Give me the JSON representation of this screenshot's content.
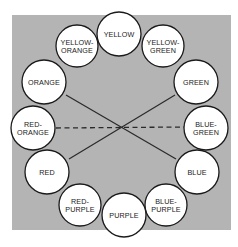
{
  "diagram": {
    "background_color": "#b4b4b4",
    "circles": [
      {
        "id": "yellow",
        "lines": [
          "YELLOW"
        ],
        "cx": 119,
        "cy": 34,
        "r": 22
      },
      {
        "id": "yellow-green",
        "lines": [
          "YELLOW-",
          "GREEN"
        ],
        "cx": 163,
        "cy": 46,
        "r": 21
      },
      {
        "id": "green",
        "lines": [
          "GREEN"
        ],
        "cx": 196,
        "cy": 82,
        "r": 22
      },
      {
        "id": "blue-green",
        "lines": [
          "BLUE-",
          "GREEN"
        ],
        "cx": 206,
        "cy": 128,
        "r": 22
      },
      {
        "id": "blue",
        "lines": [
          "BLUE"
        ],
        "cx": 197,
        "cy": 172,
        "r": 22
      },
      {
        "id": "blue-purple",
        "lines": [
          "BLUE-",
          "PURPLE"
        ],
        "cx": 166,
        "cy": 205,
        "r": 21
      },
      {
        "id": "purple",
        "lines": [
          "PURPLE"
        ],
        "cx": 124,
        "cy": 215,
        "r": 22
      },
      {
        "id": "red-purple",
        "lines": [
          "RED-",
          "PURPLE"
        ],
        "cx": 80,
        "cy": 205,
        "r": 21
      },
      {
        "id": "red",
        "lines": [
          "RED"
        ],
        "cx": 47,
        "cy": 172,
        "r": 22
      },
      {
        "id": "red-orange",
        "lines": [
          "RED-",
          "ORANGE"
        ],
        "cx": 33,
        "cy": 128,
        "r": 22
      },
      {
        "id": "orange",
        "lines": [
          "ORANGE"
        ],
        "cx": 44,
        "cy": 82,
        "r": 22
      },
      {
        "id": "yellow-orange",
        "lines": [
          "YELLOW-",
          "ORANGE"
        ],
        "cx": 77,
        "cy": 46,
        "r": 21
      }
    ],
    "connections": [
      {
        "from": "orange",
        "to": "blue",
        "style": "solid",
        "x1": 66,
        "y1": 95,
        "x2": 176,
        "y2": 159
      },
      {
        "from": "green",
        "to": "red",
        "style": "solid",
        "x1": 175,
        "y1": 95,
        "x2": 69,
        "y2": 159
      },
      {
        "from": "red-orange",
        "to": "blue-green",
        "style": "dashed",
        "x1": 56,
        "y1": 128,
        "x2": 184,
        "y2": 127
      }
    ]
  }
}
